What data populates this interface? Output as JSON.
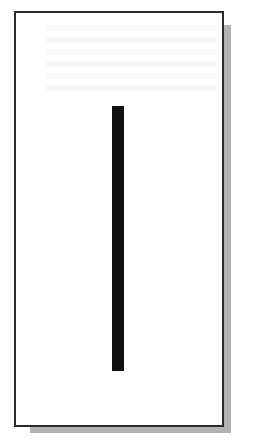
{
  "figure": {
    "shape": "vertical-bar",
    "colors": {
      "frame_border": "#2a2a2a",
      "frame_fill": "#ffffff",
      "shadow": "#b3b3b3",
      "bar": "#111111",
      "background": "#ffffff"
    }
  }
}
